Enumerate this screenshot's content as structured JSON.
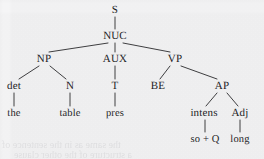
{
  "figure": {
    "kind": "constituency-syntax-tree",
    "background_color": "#f5f5f6",
    "ink_color": "#1d1d1f",
    "width": 264,
    "height": 159
  },
  "nodes": [
    {
      "id": "s",
      "label": "S",
      "x": 115,
      "y": 10,
      "level": 0,
      "role": "root-category"
    },
    {
      "id": "nuc",
      "label": "NUC",
      "x": 115,
      "y": 36,
      "level": 1,
      "role": "category"
    },
    {
      "id": "np",
      "label": "NP",
      "x": 44,
      "y": 59,
      "level": 2,
      "role": "category"
    },
    {
      "id": "aux",
      "label": "AUX",
      "x": 115,
      "y": 59,
      "level": 2,
      "role": "category"
    },
    {
      "id": "vp",
      "label": "VP",
      "x": 175,
      "y": 59,
      "level": 2,
      "role": "category"
    },
    {
      "id": "det",
      "label": "det",
      "x": 14,
      "y": 86,
      "level": 3,
      "role": "category"
    },
    {
      "id": "n",
      "label": "N",
      "x": 70,
      "y": 86,
      "level": 3,
      "role": "category"
    },
    {
      "id": "t",
      "label": "T",
      "x": 115,
      "y": 86,
      "level": 3,
      "role": "category"
    },
    {
      "id": "be",
      "label": "BE",
      "x": 158,
      "y": 86,
      "level": 3,
      "role": "category"
    },
    {
      "id": "ap",
      "label": "AP",
      "x": 222,
      "y": 86,
      "level": 3,
      "role": "category"
    },
    {
      "id": "the",
      "label": "the",
      "x": 14,
      "y": 113,
      "level": 4,
      "role": "terminal"
    },
    {
      "id": "table",
      "label": "table",
      "x": 70,
      "y": 113,
      "level": 4,
      "role": "terminal"
    },
    {
      "id": "pres",
      "label": "pres",
      "x": 115,
      "y": 113,
      "level": 4,
      "role": "terminal"
    },
    {
      "id": "intens",
      "label": "intens",
      "x": 204,
      "y": 113,
      "level": 4,
      "role": "category"
    },
    {
      "id": "adj",
      "label": "Adj",
      "x": 240,
      "y": 113,
      "level": 4,
      "role": "category"
    },
    {
      "id": "soq",
      "label": "so + Q",
      "x": 205,
      "y": 139,
      "level": 5,
      "role": "terminal"
    },
    {
      "id": "long",
      "label": "long",
      "x": 240,
      "y": 139,
      "level": 5,
      "role": "terminal"
    }
  ],
  "edges": [
    {
      "from": "s",
      "to": "nuc",
      "x1": 115,
      "y1": 17,
      "x2": 115,
      "y2": 29
    },
    {
      "from": "nuc",
      "to": "np",
      "x1": 108,
      "y1": 43,
      "x2": 49,
      "y2": 52
    },
    {
      "from": "nuc",
      "to": "aux",
      "x1": 115,
      "y1": 43,
      "x2": 115,
      "y2": 52
    },
    {
      "from": "nuc",
      "to": "vp",
      "x1": 123,
      "y1": 43,
      "x2": 170,
      "y2": 52
    },
    {
      "from": "np",
      "to": "det",
      "x1": 39,
      "y1": 66,
      "x2": 19,
      "y2": 79
    },
    {
      "from": "np",
      "to": "n",
      "x1": 50,
      "y1": 66,
      "x2": 66,
      "y2": 79
    },
    {
      "from": "aux",
      "to": "t",
      "x1": 115,
      "y1": 66,
      "x2": 115,
      "y2": 79
    },
    {
      "from": "vp",
      "to": "be",
      "x1": 170,
      "y1": 66,
      "x2": 160,
      "y2": 79
    },
    {
      "from": "vp",
      "to": "ap",
      "x1": 181,
      "y1": 66,
      "x2": 217,
      "y2": 79
    },
    {
      "from": "det",
      "to": "the",
      "x1": 14,
      "y1": 93,
      "x2": 14,
      "y2": 106
    },
    {
      "from": "n",
      "to": "table",
      "x1": 70,
      "y1": 93,
      "x2": 70,
      "y2": 106
    },
    {
      "from": "t",
      "to": "pres",
      "x1": 115,
      "y1": 93,
      "x2": 115,
      "y2": 106
    },
    {
      "from": "ap",
      "to": "intens",
      "x1": 217,
      "y1": 93,
      "x2": 206,
      "y2": 106
    },
    {
      "from": "ap",
      "to": "adj",
      "x1": 227,
      "y1": 93,
      "x2": 238,
      "y2": 106
    },
    {
      "from": "intens",
      "to": "soq",
      "x1": 205,
      "y1": 120,
      "x2": 205,
      "y2": 132
    },
    {
      "from": "adj",
      "to": "long",
      "x1": 240,
      "y1": 120,
      "x2": 240,
      "y2": 132
    }
  ],
  "artifacts": {
    "bleed_through_line_1": "the same as in the sentence of",
    "bleed_through_line_2": "a structure of the other clause"
  }
}
